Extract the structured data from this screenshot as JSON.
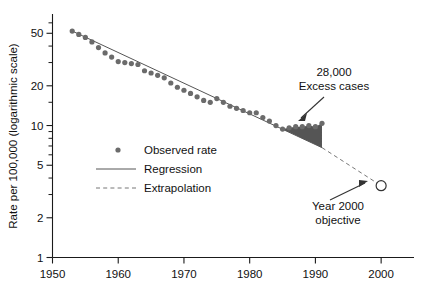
{
  "chart_data": {
    "type": "scatter",
    "title": "",
    "xlabel": "",
    "ylabel": "Rate per 100,000 (logarithmic scale)",
    "yscale": "log",
    "ylim": [
      1,
      70
    ],
    "xlim": [
      1950,
      2005
    ],
    "grid": false,
    "legend_position": "center-left",
    "y_ticks_major": [
      1,
      2,
      5,
      10,
      20,
      50
    ],
    "y_tick_labels": [
      "1",
      "2",
      "5",
      "10",
      "20",
      "50"
    ],
    "y_ticks_minor": [
      3,
      4,
      6,
      7,
      8,
      9,
      15,
      30,
      40,
      60
    ],
    "x_ticks_major": [
      1950,
      1960,
      1970,
      1980,
      1990,
      2000
    ],
    "x_tick_labels": [
      "1950",
      "1960",
      "1970",
      "1980",
      "1990",
      "2000"
    ],
    "series": [
      {
        "name": "Observed rate",
        "type": "scatter",
        "color": "#6b6b6b",
        "x": [
          1953,
          1954,
          1955,
          1956,
          1957,
          1958,
          1959,
          1960,
          1961,
          1962,
          1963,
          1964,
          1965,
          1966,
          1967,
          1968,
          1969,
          1970,
          1971,
          1972,
          1973,
          1974,
          1975,
          1976,
          1977,
          1978,
          1979,
          1980,
          1981,
          1982,
          1983,
          1984,
          1985,
          1986,
          1987,
          1988,
          1989,
          1990,
          1991
        ],
        "values": [
          52.0,
          49.0,
          46.5,
          43.0,
          39.0,
          35.5,
          33.0,
          30.5,
          30.0,
          29.5,
          29.0,
          26.0,
          25.0,
          24.0,
          23.0,
          21.0,
          19.5,
          18.5,
          17.5,
          16.5,
          15.5,
          15.0,
          16.0,
          15.0,
          14.0,
          13.5,
          13.0,
          12.5,
          12.5,
          11.5,
          10.8,
          10.0,
          9.4,
          9.6,
          9.8,
          9.8,
          10.0,
          9.8,
          10.4
        ]
      },
      {
        "name": "Regression",
        "type": "line",
        "color": "#555555",
        "x": [
          1953,
          1991
        ],
        "values": [
          52.0,
          6.8
        ]
      },
      {
        "name": "Extrapolation",
        "type": "line",
        "style": "dashed",
        "color": "#777777",
        "x": [
          1991,
          2000
        ],
        "values": [
          6.8,
          3.5
        ]
      }
    ],
    "shaded_region": {
      "name": "Excess cases",
      "color": "#555555",
      "x_start": 1985,
      "x_end": 1991,
      "label": "28,000 Excess cases"
    },
    "markers": [
      {
        "name": "Year 2000 objective",
        "x": 2000,
        "value": 3.5,
        "style": "open-circle"
      }
    ],
    "annotations": [
      {
        "name": "excess-cases",
        "line1": "28,000",
        "line2": "Excess cases",
        "points_to": [
          1990.5,
          9.0
        ]
      },
      {
        "name": "year-2000-objective",
        "line1": "Year 2000",
        "line2": "objective",
        "points_to": [
          2000,
          3.5
        ]
      }
    ],
    "legend_entries": [
      {
        "label": "Observed rate",
        "symbol": "dot"
      },
      {
        "label": "Regression",
        "symbol": "solid-line"
      },
      {
        "label": "Extrapolation",
        "symbol": "dashed-line"
      }
    ]
  },
  "axes": {
    "y_label": "Rate per 100,000 (logarithmic scale)",
    "y_ticks": [
      {
        "value": "50"
      },
      {
        "value": "20"
      },
      {
        "value": "10"
      },
      {
        "value": "5"
      },
      {
        "value": "2"
      },
      {
        "value": "1"
      }
    ],
    "x_ticks": [
      {
        "value": "1950"
      },
      {
        "value": "1960"
      },
      {
        "value": "1970"
      },
      {
        "value": "1980"
      },
      {
        "value": "1990"
      },
      {
        "value": "2000"
      }
    ]
  },
  "legend": {
    "items": [
      {
        "label": "Observed rate"
      },
      {
        "label": "Regression"
      },
      {
        "label": "Extrapolation"
      }
    ]
  },
  "annotations": {
    "excess": {
      "line1": "28,000",
      "line2": "Excess cases"
    },
    "objective": {
      "line1": "Year 2000",
      "line2": "objective"
    }
  }
}
